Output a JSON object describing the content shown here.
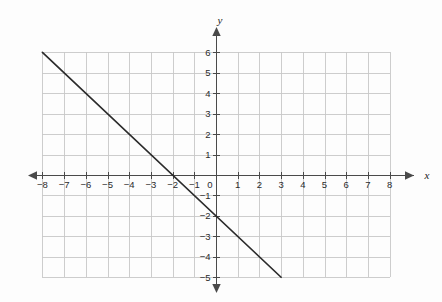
{
  "figure": {
    "background_color": "#fdfdfd",
    "grid_color": "#c8c8c8",
    "axis_color": "#4a4a4a",
    "line_color": "#2b2b2b",
    "label_color": "#2b2b2b"
  },
  "axes": {
    "x_axis_label": "x",
    "y_axis_label": "y",
    "x_tick_labels": [
      "−8",
      "−7",
      "−6",
      "−5",
      "−4",
      "−3",
      "−2",
      "−1",
      "0",
      "1",
      "2",
      "3",
      "4",
      "5",
      "6",
      "7",
      "8"
    ],
    "y_tick_labels_positive": [
      "6",
      "5",
      "4",
      "3",
      "2",
      "1"
    ],
    "y_tick_labels_negative": [
      "−1",
      "−2",
      "−3",
      "−4",
      "−5"
    ],
    "origin_label": "0"
  },
  "chart_data": {
    "type": "line",
    "title": "",
    "xlabel": "x",
    "ylabel": "y",
    "xlim": [
      -8,
      8
    ],
    "ylim": [
      -5,
      6
    ],
    "xticks": [
      -8,
      -7,
      -6,
      -5,
      -4,
      -3,
      -2,
      -1,
      0,
      1,
      2,
      3,
      4,
      5,
      6,
      7,
      8
    ],
    "yticks": [
      -5,
      -4,
      -3,
      -2,
      -1,
      0,
      1,
      2,
      3,
      4,
      5,
      6
    ],
    "grid": true,
    "grid_spacing": 1,
    "legend": null,
    "series": [
      {
        "name": "line",
        "equation": "y = -x - 2",
        "slope": -1,
        "intercept": -2,
        "x_intercept": -2,
        "y_intercept": -2,
        "x": [
          -8,
          3
        ],
        "values": [
          6,
          -5
        ],
        "points": [
          [
            -8,
            6
          ],
          [
            3,
            -5
          ]
        ]
      }
    ],
    "annotations": []
  }
}
